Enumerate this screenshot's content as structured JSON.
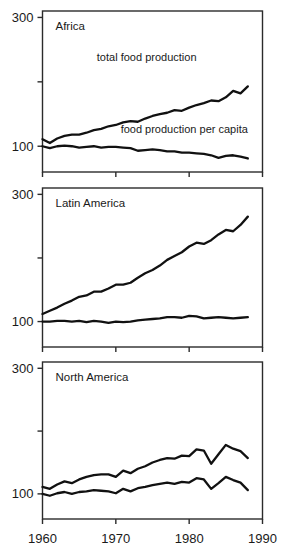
{
  "chart_data": {
    "type": "line",
    "title": "",
    "xlabel": "",
    "ylabel": "",
    "xlim": [
      1960,
      1990
    ],
    "ylim": [
      60,
      310
    ],
    "grid": false,
    "legend_position": "inline-annotation",
    "x_ticks": [
      1960,
      1970,
      1980,
      1990
    ],
    "x_tick_labels": [
      "1960",
      "1970",
      "1980",
      "1990"
    ],
    "y_ticks": [
      100,
      200,
      300
    ],
    "y_tick_labels": [
      "100",
      "",
      "300"
    ],
    "annotations": [
      {
        "text": "total food production",
        "panel": "Africa",
        "x": 1981,
        "y": 232
      },
      {
        "text": "food production per capita",
        "panel": "Africa",
        "x": 1988,
        "y": 120
      }
    ],
    "panels": [
      {
        "name": "Africa",
        "title": "Africa",
        "x": [
          1960,
          1961,
          1962,
          1963,
          1964,
          1965,
          1966,
          1967,
          1968,
          1969,
          1970,
          1971,
          1972,
          1973,
          1974,
          1975,
          1976,
          1977,
          1978,
          1979,
          1980,
          1981,
          1982,
          1983,
          1984,
          1985,
          1986,
          1987,
          1988
        ],
        "series": [
          {
            "name": "total food production",
            "values": [
              111,
              105,
              112,
              116,
              118,
              118,
              121,
              125,
              127,
              131,
              133,
              137,
              139,
              138,
              143,
              147,
              150,
              152,
              156,
              155,
              160,
              164,
              167,
              171,
              170,
              176,
              186,
              182,
              193
            ]
          },
          {
            "name": "food production per capita",
            "values": [
              100,
              97,
              100,
              101,
              100,
              98,
              99,
              100,
              98,
              99,
              99,
              98,
              97,
              93,
              94,
              95,
              94,
              92,
              92,
              90,
              90,
              89,
              88,
              86,
              82,
              85,
              86,
              84,
              81
            ]
          }
        ]
      },
      {
        "name": "Latin America",
        "title": "Latin America",
        "x": [
          1960,
          1961,
          1962,
          1963,
          1964,
          1965,
          1966,
          1967,
          1968,
          1969,
          1970,
          1971,
          1972,
          1973,
          1974,
          1975,
          1976,
          1977,
          1978,
          1979,
          1980,
          1981,
          1982,
          1983,
          1984,
          1985,
          1986,
          1987,
          1988
        ],
        "series": [
          {
            "name": "total food production",
            "values": [
              112,
              117,
              122,
              128,
              133,
              139,
              141,
              147,
              147,
              152,
              158,
              158,
              161,
              169,
              176,
              181,
              188,
              197,
              203,
              209,
              218,
              224,
              222,
              228,
              237,
              244,
              242,
              252,
              265
            ]
          },
          {
            "name": "food production per capita",
            "values": [
              100,
              100,
              101,
              101,
              100,
              101,
              99,
              101,
              100,
              98,
              100,
              99,
              100,
              102,
              103,
              104,
              105,
              107,
              107,
              106,
              109,
              108,
              105,
              106,
              107,
              106,
              105,
              106,
              107
            ]
          }
        ]
      },
      {
        "name": "North America",
        "title": "North America",
        "x": [
          1960,
          1961,
          1962,
          1963,
          1964,
          1965,
          1966,
          1967,
          1968,
          1969,
          1970,
          1971,
          1972,
          1973,
          1974,
          1975,
          1976,
          1977,
          1978,
          1979,
          1980,
          1981,
          1982,
          1983,
          1984,
          1985,
          1986,
          1987,
          1988
        ],
        "series": [
          {
            "name": "total food production",
            "values": [
              111,
              108,
              115,
              120,
              117,
              123,
              127,
              130,
              131,
              131,
              127,
              137,
              133,
              140,
              144,
              150,
              154,
              157,
              156,
              161,
              160,
              171,
              169,
              148,
              163,
              178,
              172,
              168,
              157
            ]
          },
          {
            "name": "food production per capita",
            "values": [
              100,
              97,
              101,
              103,
              100,
              103,
              104,
              106,
              105,
              104,
              101,
              108,
              104,
              109,
              111,
              114,
              116,
              118,
              116,
              119,
              118,
              125,
              123,
              108,
              117,
              127,
              122,
              118,
              106
            ]
          }
        ]
      }
    ]
  }
}
